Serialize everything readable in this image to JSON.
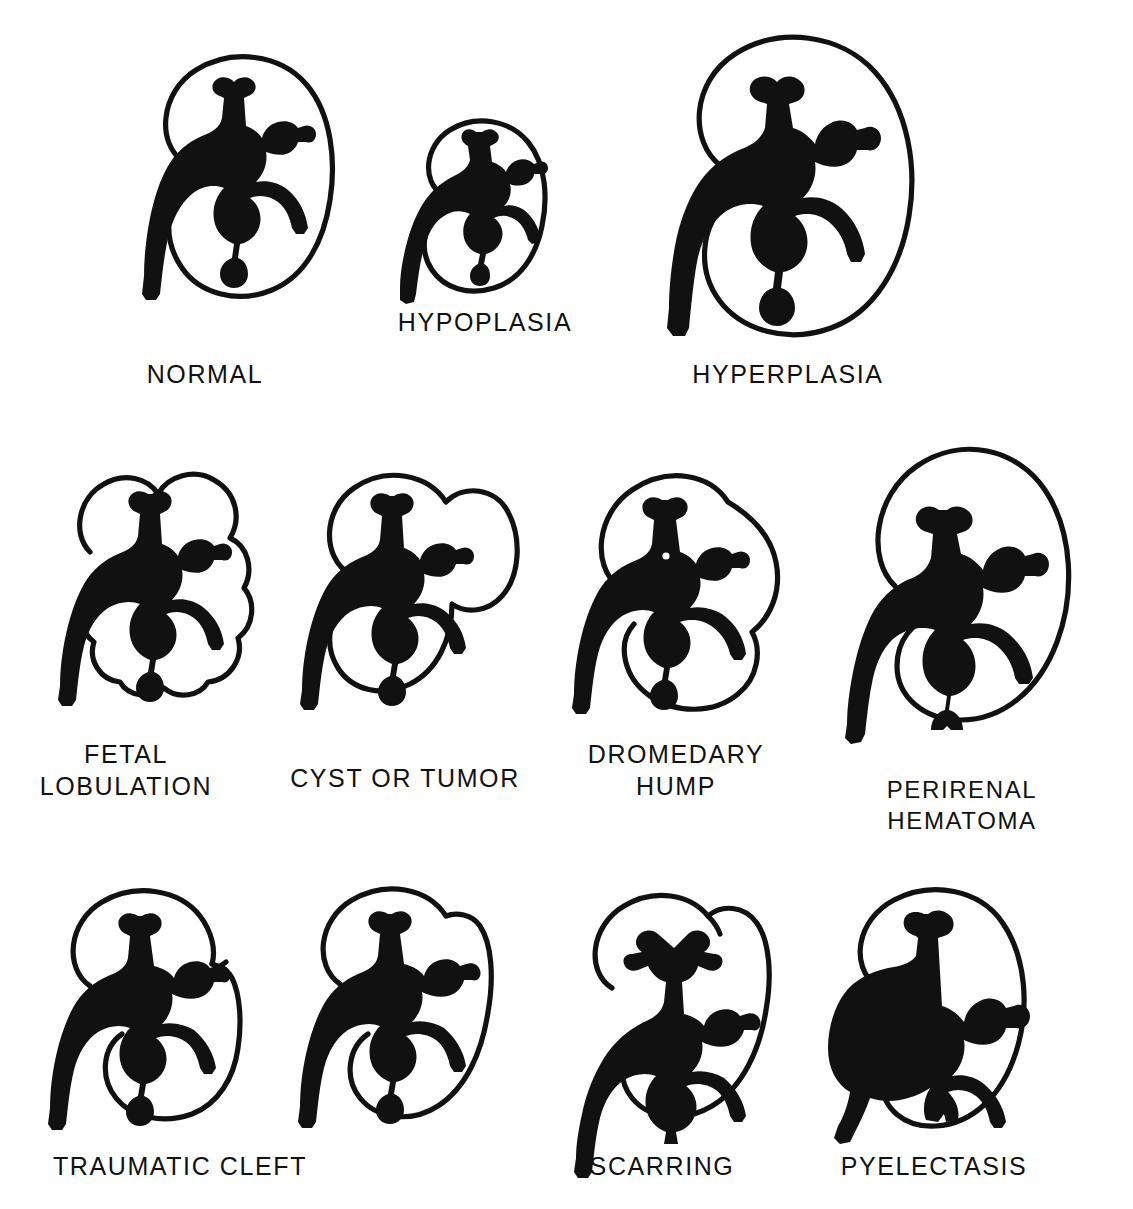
{
  "figure": {
    "background_color": "#ffffff",
    "ink_color": "#111111",
    "rows": 3,
    "panel_count": 11
  },
  "panels": [
    {
      "id": "normal",
      "label": "NORMAL",
      "row": 1,
      "col": 1
    },
    {
      "id": "hypoplasia",
      "label": "HYPOPLASIA",
      "row": 1,
      "col": 2
    },
    {
      "id": "hyperplasia",
      "label": "HYPERPLASIA",
      "row": 1,
      "col": 3
    },
    {
      "id": "fetal-lobulation",
      "label": "FETAL\nLOBULATION",
      "row": 2,
      "col": 1
    },
    {
      "id": "cyst-or-tumor",
      "label": "CYST OR TUMOR",
      "row": 2,
      "col": 2
    },
    {
      "id": "dromedary-hump",
      "label": "DROMEDARY\nHUMP",
      "row": 2,
      "col": 3
    },
    {
      "id": "perirenal-hematoma",
      "label": "PERIRENAL HEMATOMA",
      "row": 2,
      "col": 4
    },
    {
      "id": "traumatic-cleft-a",
      "label": "TRAUMATIC CLEFT",
      "row": 3,
      "col": 1
    },
    {
      "id": "traumatic-cleft-b",
      "label": "",
      "row": 3,
      "col": 2
    },
    {
      "id": "scarring",
      "label": "SCARRING",
      "row": 3,
      "col": 3
    },
    {
      "id": "pyelectasis",
      "label": "PYELECTASIS",
      "row": 3,
      "col": 4
    }
  ],
  "captions": {
    "normal": "NORMAL",
    "hypoplasia": "HYPOPLASIA",
    "hyperplasia": "HYPERPLASIA",
    "fetal_lobulation": "FETAL\nLOBULATION",
    "cyst_or_tumor": "CYST OR TUMOR",
    "dromedary_hump": "DROMEDARY\nHUMP",
    "perirenal_hematoma": "PERIRENAL HEMATOMA",
    "traumatic_cleft": "TRAUMATIC CLEFT",
    "scarring": "SCARRING",
    "pyelectasis": "PYELECTASIS"
  }
}
